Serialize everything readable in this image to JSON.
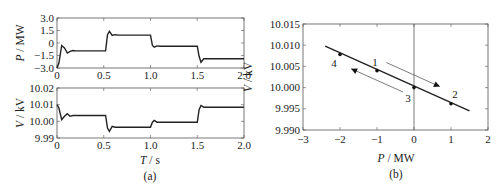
{
  "chart_data": [
    {
      "id": "a-top",
      "type": "line",
      "ylabel": "P / MW",
      "xlabel": "",
      "xlim": [
        0,
        2.0
      ],
      "ylim": [
        -3.0,
        3.0
      ],
      "xticks": [
        "0",
        "0.5",
        "1.0",
        "1.5",
        "2.0"
      ],
      "yticks": [
        "3.0",
        "1.5",
        "0",
        "−1.5",
        "−3.0"
      ],
      "ytick_values": [
        3.0,
        1.5,
        0,
        -1.5,
        -3.0
      ],
      "series": [
        {
          "name": "P",
          "x": [
            0,
            0.02,
            0.05,
            0.08,
            0.11,
            0.14,
            0.17,
            0.2,
            0.25,
            0.3,
            0.52,
            0.54,
            0.56,
            0.59,
            0.62,
            0.66,
            0.7,
            1.0,
            1.02,
            1.04,
            1.07,
            1.1,
            1.15,
            1.5,
            1.52,
            1.54,
            1.57,
            1.6,
            1.65,
            2.0
          ],
          "y": [
            -3.0,
            -2.4,
            -0.3,
            -0.6,
            -1.2,
            -1.0,
            -0.9,
            -0.95,
            -0.95,
            -0.95,
            -0.95,
            1.0,
            1.4,
            0.9,
            1.0,
            0.95,
            0.95,
            0.95,
            -0.3,
            -0.5,
            -0.35,
            -0.4,
            -0.4,
            -0.4,
            -1.6,
            -2.3,
            -1.9,
            -1.9,
            -1.9,
            -1.9
          ]
        }
      ],
      "caption": ""
    },
    {
      "id": "a-bottom",
      "type": "line",
      "ylabel": "V / kV",
      "xlabel": "T / s",
      "xlim": [
        0,
        2.0
      ],
      "ylim": [
        9.99,
        10.02
      ],
      "xticks": [
        "0",
        "0.5",
        "1.0",
        "1.5",
        "2.0"
      ],
      "yticks": [
        "10.02",
        "10.01",
        "10.00",
        "9.99"
      ],
      "ytick_values": [
        10.02,
        10.01,
        10.0,
        9.99
      ],
      "series": [
        {
          "name": "V",
          "x": [
            0,
            0.02,
            0.05,
            0.08,
            0.11,
            0.14,
            0.17,
            0.2,
            0.25,
            0.52,
            0.54,
            0.56,
            0.59,
            0.62,
            0.66,
            0.7,
            1.0,
            1.02,
            1.04,
            1.07,
            1.1,
            1.15,
            1.5,
            1.52,
            1.54,
            1.57,
            1.6,
            1.65,
            2.0
          ],
          "y": [
            10.01,
            10.008,
            10.001,
            10.003,
            10.0045,
            10.003,
            10.0035,
            10.0035,
            10.0035,
            10.0035,
            9.996,
            9.994,
            9.997,
            9.9965,
            9.9965,
            9.9965,
            9.9965,
            9.9995,
            10.0005,
            9.9995,
            9.9995,
            9.9995,
            9.9995,
            10.007,
            10.0095,
            10.0085,
            10.0085,
            10.0085,
            10.0085
          ]
        }
      ],
      "caption": "(a)"
    },
    {
      "id": "b",
      "type": "line",
      "ylabel": "V / kV",
      "xlabel": "P / MW",
      "xlim": [
        -3,
        2
      ],
      "ylim": [
        9.99,
        10.015
      ],
      "xticks": [
        "−3",
        "−2",
        "−1",
        "0",
        "1",
        "2"
      ],
      "xtick_values": [
        -3,
        -2,
        -1,
        0,
        1,
        2
      ],
      "yticks": [
        "10.015",
        "10.010",
        "10.005",
        "10.000",
        "9.995",
        "9.990"
      ],
      "ytick_values": [
        10.015,
        10.01,
        10.005,
        10.0,
        9.995,
        9.99
      ],
      "series": [
        {
          "name": "droop",
          "x": [
            -2.4,
            1.5
          ],
          "y": [
            10.0098,
            9.9945
          ]
        }
      ],
      "points": [
        {
          "label": "1",
          "x": -1.0,
          "y": 10.004
        },
        {
          "label": "2",
          "x": 1.0,
          "y": 9.9962
        },
        {
          "label": "3",
          "x": 0.0,
          "y": 10.0
        },
        {
          "label": "4",
          "x": -2.0,
          "y": 10.0078
        }
      ],
      "annotations": [
        "arrow 1→2 (down-right, above line)",
        "arrow 3→4 (up-left, below line)"
      ],
      "caption": "(b)"
    }
  ]
}
